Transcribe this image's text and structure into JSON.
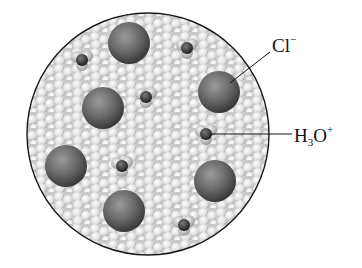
{
  "diagram": {
    "title": "",
    "labels": {
      "chloride": {
        "base": "Cl",
        "sup": "−"
      },
      "hydronium": {
        "base": "H",
        "sub": "3",
        "mid": "O",
        "sup": "+"
      }
    },
    "colors": {
      "background": "#ffffff",
      "border": "#1a1a1a",
      "water_light": "#e8e8e8",
      "water_mid": "#bdbdbd",
      "ion_dark": "#4a4a4a",
      "ion_light": "#a8a8a8"
    },
    "chloride_ions": [
      {
        "cx": 129,
        "cy": 43,
        "r": 21
      },
      {
        "cx": 103,
        "cy": 108,
        "r": 21
      },
      {
        "cx": 219,
        "cy": 92,
        "r": 21
      },
      {
        "cx": 66,
        "cy": 166,
        "r": 21
      },
      {
        "cx": 215,
        "cy": 181,
        "r": 21
      },
      {
        "cx": 124,
        "cy": 211,
        "r": 21
      }
    ],
    "hydronium_ions": [
      {
        "cx": 82,
        "cy": 60
      },
      {
        "cx": 187,
        "cy": 48
      },
      {
        "cx": 146,
        "cy": 97
      },
      {
        "cx": 206,
        "cy": 134
      },
      {
        "cx": 122,
        "cy": 166
      },
      {
        "cx": 184,
        "cy": 225
      }
    ]
  }
}
